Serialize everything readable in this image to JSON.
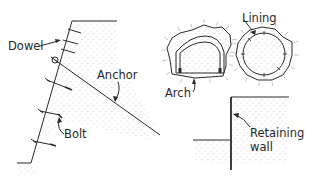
{
  "figure": {
    "type": "geotechnical reinforcement examples",
    "colors": {
      "ink": "#2a2a2a",
      "soil_stipple": "#9a9a9a",
      "background": "#ffffff"
    }
  },
  "slope": {
    "labels": {
      "dowel": "Dowel",
      "anchor": "Anchor",
      "bolt": "Bolt"
    }
  },
  "tunnels": {
    "labels": {
      "lining": "Lining",
      "arch": "Arch"
    }
  },
  "retaining_wall": {
    "label_line1": "Retaining",
    "label_line2": "wall"
  }
}
